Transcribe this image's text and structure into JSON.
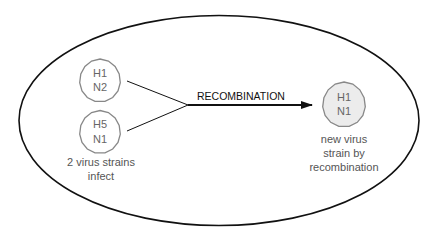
{
  "diagram": {
    "container": {
      "shape": "ellipse"
    },
    "input_strains": [
      {
        "h": "H1",
        "n": "N2"
      },
      {
        "h": "H5",
        "n": "N1"
      }
    ],
    "input_caption": [
      "2 virus strains",
      "infect"
    ],
    "process_label": "RECOMBINATION",
    "output_strain": {
      "h": "H1",
      "n": "N1"
    },
    "output_caption": [
      "new virus",
      "strain by",
      "recombination"
    ],
    "colors": {
      "stroke": "#111111",
      "octagon_stroke": "#888888",
      "output_fill": "#ececec",
      "text": "#555555"
    }
  }
}
